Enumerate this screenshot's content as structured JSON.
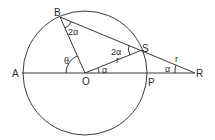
{
  "diagram": {
    "type": "geometry",
    "colors": {
      "stroke": "#3a3a3a",
      "text": "#2a2a2a",
      "background": "#ffffff"
    },
    "points": {
      "A": {
        "label": "A",
        "x": 22,
        "y": 73
      },
      "O": {
        "label": "O",
        "x": 85,
        "y": 73
      },
      "P": {
        "label": "P",
        "x": 146,
        "y": 73
      },
      "R": {
        "label": "R",
        "x": 195,
        "y": 73
      },
      "B": {
        "label": "B",
        "x": 60,
        "y": 17
      },
      "S": {
        "label": "S",
        "x": 142,
        "y": 50
      }
    },
    "circle": {
      "center": "O",
      "cx": 85,
      "cy": 73,
      "r": 62
    },
    "segments": [
      [
        "A",
        "R"
      ],
      [
        "B",
        "R"
      ],
      [
        "O",
        "B"
      ],
      [
        "O",
        "S"
      ]
    ],
    "angle_labels": {
      "theta_at_O": "θ",
      "alpha_at_O": "α",
      "alpha_at_R": "α",
      "two_alpha_at_B": "2α",
      "two_alpha_at_S": "2α"
    },
    "length_labels": {
      "OS": "r",
      "SR": "r"
    }
  }
}
